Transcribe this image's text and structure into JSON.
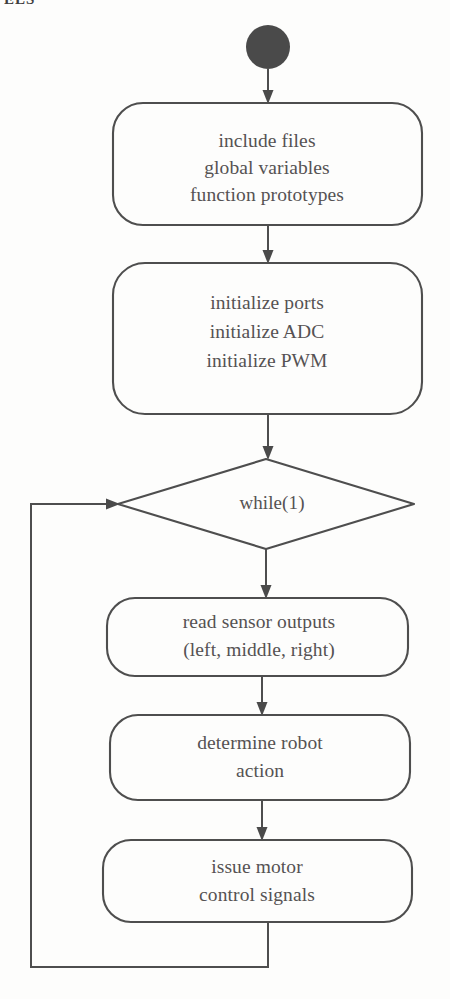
{
  "page": {
    "width": 450,
    "height": 999,
    "background_color": "#fdfdfc",
    "ink_color": "#4e4e4e",
    "text_color": "#555253",
    "cropped_header_fragment": "ELS"
  },
  "diagram": {
    "type": "flowchart",
    "nodes": [
      {
        "id": "start",
        "kind": "start-terminal",
        "shape": "filled-circle",
        "label": "",
        "cx": 268,
        "cy": 47,
        "r": 22,
        "fill": "#4a4a4a"
      },
      {
        "id": "init-globals",
        "kind": "process",
        "shape": "rounded-rectangle",
        "lines": [
          "include files",
          "global variables",
          "function prototypes"
        ],
        "x": 113,
        "y": 103,
        "w": 309,
        "h": 122
      },
      {
        "id": "init-peripherals",
        "kind": "process",
        "shape": "rounded-rectangle",
        "lines": [
          "initialize ports",
          "initialize ADC",
          "initialize PWM"
        ],
        "x": 113,
        "y": 263,
        "w": 309,
        "h": 151
      },
      {
        "id": "loop-condition",
        "kind": "decision",
        "shape": "diamond",
        "lines": [
          "while(1)"
        ],
        "x": 118,
        "y": 459,
        "w": 296,
        "h": 90
      },
      {
        "id": "read-sensors",
        "kind": "process",
        "shape": "rounded-rectangle",
        "lines": [
          "read sensor outputs",
          "(left, middle, right)"
        ],
        "x": 107,
        "y": 598,
        "w": 301,
        "h": 78
      },
      {
        "id": "determine-action",
        "kind": "process",
        "shape": "rounded-rectangle",
        "lines": [
          "determine robot",
          "action"
        ],
        "x": 110,
        "y": 715,
        "w": 300,
        "h": 85
      },
      {
        "id": "issue-motor-signals",
        "kind": "process",
        "shape": "rounded-rectangle",
        "lines": [
          "issue motor",
          "control signals"
        ],
        "x": 103,
        "y": 840,
        "w": 309,
        "h": 82
      }
    ],
    "edges": [
      {
        "id": "e1",
        "from": "start",
        "to": "init-globals",
        "label": "",
        "arrow": true
      },
      {
        "id": "e2",
        "from": "init-globals",
        "to": "init-peripherals",
        "label": "",
        "arrow": true
      },
      {
        "id": "e3",
        "from": "init-peripherals",
        "to": "loop-condition",
        "label": "",
        "arrow": true
      },
      {
        "id": "e4",
        "from": "loop-condition",
        "to": "read-sensors",
        "label": "",
        "arrow": true
      },
      {
        "id": "e5",
        "from": "read-sensors",
        "to": "determine-action",
        "label": "",
        "arrow": true
      },
      {
        "id": "e6",
        "from": "determine-action",
        "to": "issue-motor-signals",
        "label": "",
        "arrow": true
      },
      {
        "id": "e7",
        "from": "issue-motor-signals",
        "to": "loop-condition",
        "label": "",
        "arrow": true,
        "routing": "loop-back-left"
      }
    ]
  }
}
